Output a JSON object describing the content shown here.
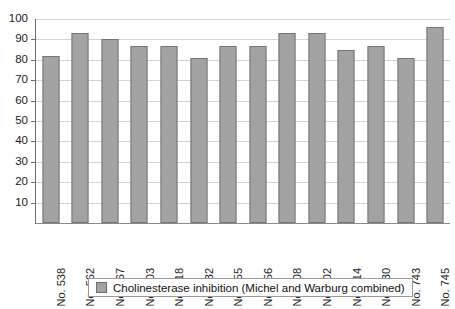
{
  "chart_data": {
    "type": "bar",
    "title": "",
    "xlabel": "",
    "ylabel": "",
    "ylim": [
      0,
      100
    ],
    "ytick_step": 10,
    "grid": true,
    "legend_position": "bottom",
    "categories": [
      "No. 538",
      "No. 562",
      "No. 567",
      "No. 603",
      "No. 618",
      "No. 632",
      "No. 655",
      "No. 656",
      "No. 708",
      "No. 702",
      "No. 714",
      "No. 730",
      "No. 743",
      "No. 745"
    ],
    "series": [
      {
        "name": "Cholinesterase inhibition (Michel and Warburg combined)",
        "color": "#a3a3a3",
        "values": [
          82,
          93,
          90,
          87,
          87,
          81,
          87,
          87,
          93,
          93,
          85,
          87,
          81,
          96
        ]
      }
    ],
    "ytick_labels": [
      "100",
      "90",
      "80",
      "70",
      "60",
      "50",
      "40",
      "30",
      "20",
      "10"
    ],
    "ytick_values": [
      100,
      90,
      80,
      70,
      60,
      50,
      40,
      30,
      20,
      10
    ]
  },
  "legend": {
    "swatch_name": "series-color-swatch",
    "label": "Cholinesterase inhibition (Michel and Warburg combined)"
  },
  "colors": {
    "bar_fill": "#a3a3a3",
    "bar_stroke": "#767676",
    "gridline": "#d2d2d2",
    "axis": "#6e6e6e",
    "background": "#ffffff",
    "text": "#1c1c1c"
  }
}
